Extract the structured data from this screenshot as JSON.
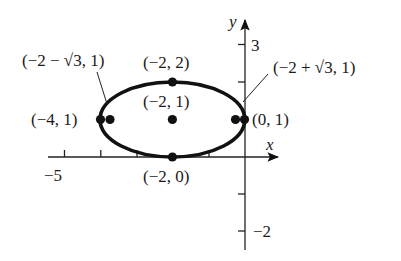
{
  "diagram": {
    "type": "ellipse-graph",
    "ink_color": "#111111",
    "axes": {
      "x_label": "x",
      "y_label": "y",
      "x_ticks": [
        -5,
        -4,
        -3,
        -2,
        -1
      ],
      "y_ticks": [
        -2,
        -1,
        1,
        2,
        3
      ],
      "x_tick_labels": [
        {
          "value": -5,
          "text": "−5"
        }
      ],
      "y_tick_labels": [
        {
          "value": 3,
          "text": "3"
        },
        {
          "value": -2,
          "text": "−2"
        }
      ]
    },
    "ellipse": {
      "center": [
        -2,
        1
      ],
      "a": 2,
      "b": 1,
      "c": "√3",
      "major_axis": "horizontal"
    },
    "points": [
      {
        "id": "vertex-left",
        "coords": [
          -4,
          1
        ],
        "label": "(−4, 1)"
      },
      {
        "id": "focus-left",
        "coords": [
          -3.732,
          1
        ],
        "label": "(−2 − √3, 1)"
      },
      {
        "id": "co-vertex-top",
        "coords": [
          -2,
          2
        ],
        "label": "(−2, 2)"
      },
      {
        "id": "center",
        "coords": [
          -2,
          1
        ],
        "label": "(−2, 1)"
      },
      {
        "id": "focus-right",
        "coords": [
          -0.268,
          1
        ],
        "label": "(−2 + √3, 1)"
      },
      {
        "id": "vertex-right",
        "coords": [
          0,
          1
        ],
        "label": "(0, 1)"
      },
      {
        "id": "co-vertex-bottom",
        "coords": [
          -2,
          0
        ],
        "label": "(−2, 0)"
      }
    ]
  }
}
